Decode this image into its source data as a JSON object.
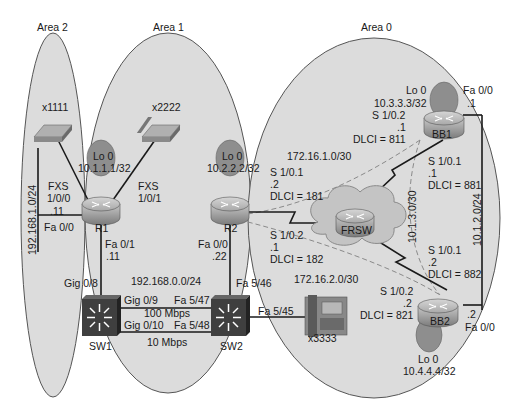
{
  "areas": [
    {
      "name": "Area 2"
    },
    {
      "name": "Area 1"
    },
    {
      "name": "Area 0"
    }
  ],
  "devices": {
    "phone_x1111": {
      "label": "x1111"
    },
    "phone_x2222": {
      "label": "x2222"
    },
    "phone_x3333": {
      "label": "x3333"
    },
    "r1": {
      "label": "R1",
      "loopback": "Lo 0",
      "loopback_ip": "10.1.1.1/32"
    },
    "r2": {
      "label": "R2",
      "loopback": "Lo 0",
      "loopback_ip": "10.2.2.2/32"
    },
    "bb1": {
      "label": "BB1",
      "loopback": "Lo 0",
      "loopback_ip": "10.3.3.3/32"
    },
    "bb2": {
      "label": "BB2",
      "loopback": "Lo 0",
      "loopback_ip": "10.4.4.4/32"
    },
    "frsw": {
      "label": "FRSW"
    },
    "sw1": {
      "label": "SW1"
    },
    "sw2": {
      "label": "SW2"
    }
  },
  "interfaces": {
    "r1_fxs_100": {
      "line1": "FXS",
      "line2": "1/0/0"
    },
    "r1_fxs_101": {
      "line1": "FXS",
      "line2": "1/0/1"
    },
    "r1_fa00": {
      "name": "Fa 0/0",
      "host": ".11"
    },
    "r1_fa01": {
      "name": "Fa 0/1",
      "host": ".11"
    },
    "r2_fa00": {
      "name": "Fa 0/0",
      "host": ".22"
    },
    "sw1_gig08": "Gig 0/8",
    "sw1_gig09": "Gig 0/9",
    "sw1_gig010": "Gig 0/10",
    "sw2_fa547": "Fa 5/47",
    "sw2_fa548": "Fa 5/48",
    "sw2_fa546": "Fa 5/46",
    "sw2_fa545": "Fa 5/45",
    "r2_s101": {
      "name": "S 1/0.1",
      "host": ".2",
      "dlci": "DLCI = 181"
    },
    "r2_s102": {
      "name": "S 1/0.2",
      "host": ".1",
      "dlci": "DLCI = 182"
    },
    "bb1_s102": {
      "name": "S 1/0.2",
      "host": ".1",
      "dlci": "DLCI = 811"
    },
    "bb1_s101": {
      "name": "S 1/0.1",
      "host": ".1",
      "dlci": "DLCI = 881"
    },
    "bb2_s101": {
      "name": "S 1/0.1",
      "host": ".2",
      "dlci": "DLCI = 882"
    },
    "bb2_s102": {
      "name": "S 1/0.2",
      "host": ".2",
      "dlci": "DLCI = 821"
    },
    "bb1_fa00": {
      "name": "Fa 0/0",
      "host": ".1"
    },
    "bb2_fa00": {
      "name": "Fa 0/0",
      "host": ".2"
    }
  },
  "subnets": {
    "area2_lan": "192.168.1.0/24",
    "area1_lan": "192.168.0.0/24",
    "fr_r2_bb1": "172.16.1.0/30",
    "fr_r2_bb2": "172.16.2.0/30",
    "fr_bb1_bb2": "10.1.3.0/30",
    "bb_lan": "10.1.2.0/24"
  },
  "links": {
    "trunk1_speed": "100 Mbps",
    "trunk2_speed": "10 Mbps"
  },
  "colors": {
    "area_fill": "#dcdcdc",
    "area_stroke": "#555555",
    "router_body": "#9a9a9a",
    "loopback_fill": "#8e8e8e",
    "switch_fill": "#3f3f3f",
    "cloud_fill": "#c4c4c4",
    "line": "#1a1a1a",
    "dashed": "#8a8a8a"
  }
}
